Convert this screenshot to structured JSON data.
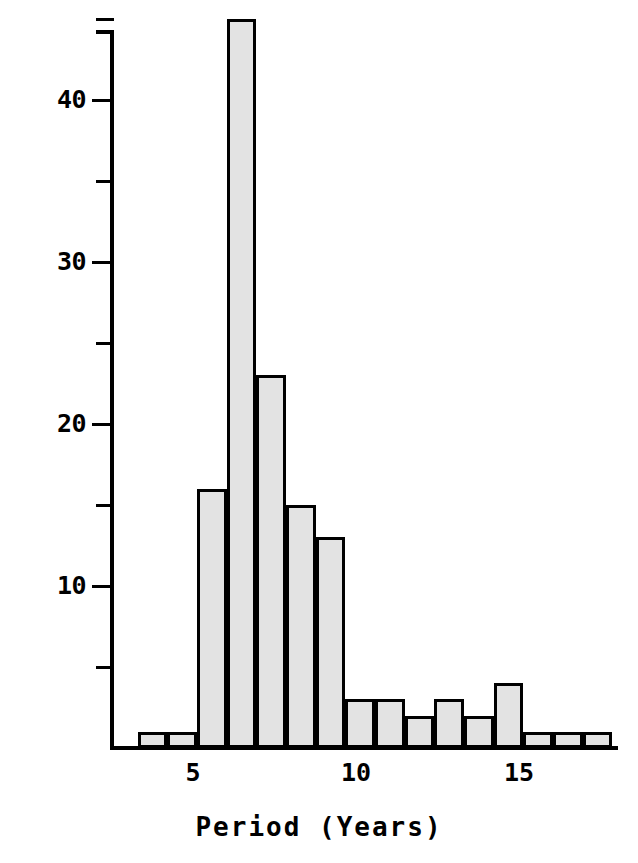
{
  "chart_data": {
    "type": "bar",
    "title": "",
    "subtitle": "",
    "xlabel": "Period (Years)",
    "ylabel": "Comet Count",
    "xlim": [
      3.3,
      17.9
    ],
    "ylim": [
      0,
      46
    ],
    "grid": false,
    "legend": null,
    "bin_width": 0.91,
    "x_ticks": [
      5,
      10,
      15
    ],
    "x_tick_labels": [
      "5",
      "10",
      "15"
    ],
    "y_ticks_major": [
      10,
      20,
      30,
      40
    ],
    "y_tick_labels": [
      "10",
      "20",
      "30",
      "40"
    ],
    "y_ticks_minor": [
      5,
      15,
      25,
      35,
      45
    ],
    "bin_starts": [
      3.3,
      4.21,
      5.12,
      6.03,
      6.94,
      7.85,
      8.76,
      9.67,
      10.58,
      11.49,
      12.4,
      13.31,
      14.22,
      15.13,
      16.04,
      16.95
    ],
    "bin_ends": [
      4.21,
      5.12,
      6.03,
      6.94,
      7.85,
      8.76,
      9.67,
      10.58,
      11.49,
      12.4,
      13.31,
      14.22,
      15.13,
      16.04,
      16.95,
      17.86
    ],
    "bin_centers": [
      3.76,
      4.67,
      5.58,
      6.49,
      7.4,
      8.31,
      9.22,
      10.13,
      11.04,
      11.95,
      12.86,
      13.77,
      14.68,
      15.59,
      16.5,
      17.41
    ],
    "categories": [
      "3.3-4.2",
      "4.2-5.1",
      "5.1-6.0",
      "6.0-6.9",
      "6.9-7.9",
      "7.9-8.8",
      "8.8-9.7",
      "9.7-10.6",
      "10.6-11.5",
      "11.5-12.4",
      "12.4-13.3",
      "13.3-14.2",
      "14.2-15.1",
      "15.1-16.0",
      "16.0-17.0",
      "17.0-17.9"
    ],
    "values": [
      1,
      1,
      16,
      45,
      23,
      15,
      13,
      3,
      3,
      2,
      3,
      2,
      4,
      1,
      1,
      1
    ]
  },
  "style": {
    "bar_fill": "#e3e3e3",
    "bar_edge": "#000000",
    "axis_color": "#000000",
    "background": "#ffffff",
    "text_color": "#000000"
  }
}
